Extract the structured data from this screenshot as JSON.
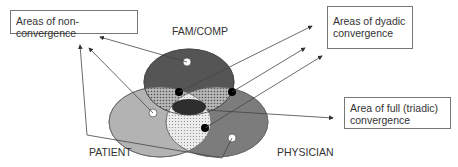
{
  "diagram": {
    "type": "venn",
    "sets": [
      {
        "name": "FAM/COMP",
        "color": "#555555"
      },
      {
        "name": "PATIENT",
        "color": "#b0b0b0"
      },
      {
        "name": "PHYSICIAN",
        "color": "#7a7a7a"
      }
    ],
    "callouts": {
      "non_convergence": "Areas of non-convergence",
      "dyadic_line1": "Areas of dyadic",
      "dyadic_line2": "convergence",
      "triadic_line1": "Area of full (triadic)",
      "triadic_line2": "convergence"
    },
    "labels": {
      "fam_comp": "FAM/COMP",
      "patient": "PATIENT",
      "physician": "PHYSICIAN"
    }
  }
}
